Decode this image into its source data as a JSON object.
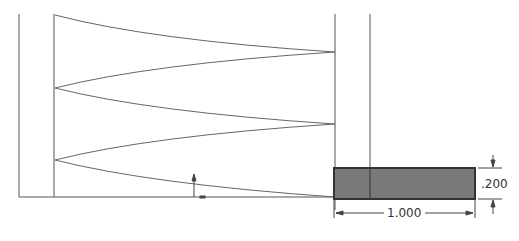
{
  "diagram": {
    "type": "engineering-drawing",
    "colors": {
      "line": "#555555",
      "profile_fill": "#7a7a7a",
      "profile_border": "#333333",
      "background": "#ffffff"
    },
    "dimensions": {
      "width_label": "1.000",
      "height_label": ".200"
    }
  }
}
